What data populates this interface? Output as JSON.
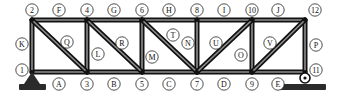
{
  "diagram": {
    "type": "truss",
    "geometry": {
      "width": 337,
      "height": 100,
      "top_chord_y": 20,
      "bottom_chord_y": 72,
      "panel_x": [
        32,
        87,
        142,
        197,
        252,
        305
      ]
    },
    "joints": [
      {
        "id": "1",
        "label": "1",
        "x": 32,
        "y": 72,
        "label_x": 22,
        "label_y": 70
      },
      {
        "id": "2",
        "label": "2",
        "x": 32,
        "y": 20,
        "label_x": 32,
        "label_y": 10
      },
      {
        "id": "3",
        "label": "3",
        "x": 87,
        "y": 72,
        "label_x": 87,
        "label_y": 84
      },
      {
        "id": "4",
        "label": "4",
        "x": 87,
        "y": 20,
        "label_x": 87,
        "label_y": 10
      },
      {
        "id": "5",
        "label": "5",
        "x": 142,
        "y": 72,
        "label_x": 142,
        "label_y": 84
      },
      {
        "id": "6",
        "label": "6",
        "x": 142,
        "y": 20,
        "label_x": 142,
        "label_y": 10
      },
      {
        "id": "7",
        "label": "7",
        "x": 197,
        "y": 72,
        "label_x": 197,
        "label_y": 84
      },
      {
        "id": "8",
        "label": "8",
        "x": 197,
        "y": 20,
        "label_x": 197,
        "label_y": 10
      },
      {
        "id": "9",
        "label": "9",
        "x": 252,
        "y": 72,
        "label_x": 252,
        "label_y": 84
      },
      {
        "id": "10",
        "label": "10",
        "x": 252,
        "y": 20,
        "label_x": 252,
        "label_y": 10
      },
      {
        "id": "11",
        "label": "11",
        "x": 305,
        "y": 72,
        "label_x": 316,
        "label_y": 70
      },
      {
        "id": "12",
        "label": "12",
        "x": 305,
        "y": 20,
        "label_x": 315,
        "label_y": 10
      }
    ],
    "members": [
      {
        "id": "A",
        "label": "A",
        "from": "1",
        "to": "3",
        "kind": "bottom-chord",
        "label_x": 59,
        "label_y": 84
      },
      {
        "id": "B",
        "label": "B",
        "from": "3",
        "to": "5",
        "kind": "bottom-chord",
        "label_x": 114,
        "label_y": 84
      },
      {
        "id": "C",
        "label": "C",
        "from": "5",
        "to": "7",
        "kind": "bottom-chord",
        "label_x": 169,
        "label_y": 84
      },
      {
        "id": "D",
        "label": "D",
        "from": "7",
        "to": "9",
        "kind": "bottom-chord",
        "label_x": 224,
        "label_y": 84
      },
      {
        "id": "E",
        "label": "E",
        "from": "9",
        "to": "11",
        "kind": "bottom-chord",
        "label_x": 278,
        "label_y": 84
      },
      {
        "id": "F",
        "label": "F",
        "from": "2",
        "to": "4",
        "kind": "top-chord",
        "label_x": 59,
        "label_y": 10
      },
      {
        "id": "G",
        "label": "G",
        "from": "4",
        "to": "6",
        "kind": "top-chord",
        "label_x": 114,
        "label_y": 10
      },
      {
        "id": "H",
        "label": "H",
        "from": "6",
        "to": "8",
        "kind": "top-chord",
        "label_x": 169,
        "label_y": 10
      },
      {
        "id": "I",
        "label": "I",
        "from": "8",
        "to": "10",
        "kind": "top-chord",
        "label_x": 224,
        "label_y": 10
      },
      {
        "id": "J",
        "label": "J",
        "from": "10",
        "to": "12",
        "kind": "top-chord",
        "label_x": 278,
        "label_y": 10
      },
      {
        "id": "K",
        "label": "K",
        "from": "1",
        "to": "2",
        "kind": "vertical",
        "label_x": 22,
        "label_y": 44
      },
      {
        "id": "L",
        "label": "L",
        "from": "3",
        "to": "4",
        "kind": "vertical",
        "label_x": 98,
        "label_y": 54
      },
      {
        "id": "M",
        "label": "M",
        "from": "5",
        "to": "6",
        "kind": "vertical",
        "label_x": 152,
        "label_y": 57
      },
      {
        "id": "N",
        "label": "N",
        "from": "7",
        "to": "8",
        "kind": "vertical",
        "label_x": 188,
        "label_y": 43
      },
      {
        "id": "O",
        "label": "O",
        "from": "9",
        "to": "10",
        "kind": "vertical",
        "label_x": 241,
        "label_y": 55
      },
      {
        "id": "P",
        "label": "P",
        "from": "11",
        "to": "12",
        "kind": "vertical",
        "label_x": 316,
        "label_y": 45
      },
      {
        "id": "Q",
        "label": "Q",
        "from": "2",
        "to": "3",
        "kind": "diagonal",
        "label_x": 67,
        "label_y": 42
      },
      {
        "id": "R",
        "label": "R",
        "from": "4",
        "to": "5",
        "kind": "diagonal",
        "label_x": 122,
        "label_y": 43
      },
      {
        "id": "T",
        "label": "T",
        "from": "6",
        "to": "7",
        "kind": "diagonal",
        "label_x": 173,
        "label_y": 35
      },
      {
        "id": "U",
        "label": "U",
        "from": "7",
        "to": "10",
        "kind": "diagonal",
        "label_x": 216,
        "label_y": 43
      },
      {
        "id": "V",
        "label": "V",
        "from": "9",
        "to": "12",
        "kind": "diagonal",
        "label_x": 270,
        "label_y": 43
      }
    ],
    "supports": [
      {
        "id": "support-pin",
        "type": "pin",
        "at_joint": "1",
        "x": 32,
        "y": 72
      },
      {
        "id": "support-roller",
        "type": "roller",
        "at_joint": "11",
        "x": 305,
        "y": 72
      }
    ]
  }
}
